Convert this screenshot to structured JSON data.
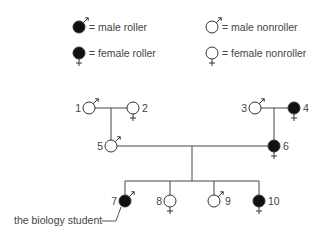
{
  "legend": {
    "items": [
      {
        "id": "male-roller",
        "sex": "male",
        "affected": true,
        "label": "= male roller",
        "cx": 79,
        "cy": 27
      },
      {
        "id": "female-roller",
        "sex": "female",
        "affected": true,
        "label": "= female roller",
        "cx": 79,
        "cy": 53
      },
      {
        "id": "male-nonroller",
        "sex": "male",
        "affected": false,
        "label": "= male nonroller",
        "cx": 212,
        "cy": 27
      },
      {
        "id": "female-nonroller",
        "sex": "female",
        "affected": false,
        "label": "= female nonroller",
        "cx": 212,
        "cy": 53
      }
    ]
  },
  "pedigree": {
    "individuals": [
      {
        "id": "1",
        "label": "1",
        "sex": "male",
        "affected": false,
        "cx": 89,
        "cy": 108,
        "label_side": "left"
      },
      {
        "id": "2",
        "label": "2",
        "sex": "female",
        "affected": false,
        "cx": 133,
        "cy": 108,
        "label_side": "right"
      },
      {
        "id": "3",
        "label": "3",
        "sex": "male",
        "affected": false,
        "cx": 255,
        "cy": 108,
        "label_side": "left"
      },
      {
        "id": "4",
        "label": "4",
        "sex": "female",
        "affected": true,
        "cx": 294,
        "cy": 108,
        "label_side": "right"
      },
      {
        "id": "5",
        "label": "5",
        "sex": "male",
        "affected": false,
        "cx": 111,
        "cy": 146,
        "label_side": "left"
      },
      {
        "id": "6",
        "label": "6",
        "sex": "female",
        "affected": true,
        "cx": 274,
        "cy": 146,
        "label_side": "right"
      },
      {
        "id": "7",
        "label": "7",
        "sex": "male",
        "affected": true,
        "cx": 125,
        "cy": 201,
        "label_side": "left"
      },
      {
        "id": "8",
        "label": "8",
        "sex": "female",
        "affected": false,
        "cx": 170,
        "cy": 201,
        "label_side": "left"
      },
      {
        "id": "9",
        "label": "9",
        "sex": "male",
        "affected": false,
        "cx": 214,
        "cy": 201,
        "label_side": "right"
      },
      {
        "id": "10",
        "label": "10",
        "sex": "female",
        "affected": true,
        "cx": 259,
        "cy": 201,
        "label_side": "right"
      }
    ],
    "lines": [
      {
        "id": "couple-1-2",
        "x1": 95,
        "y1": 108,
        "x2": 127,
        "y2": 108
      },
      {
        "id": "descent-1-2",
        "x1": 111,
        "y1": 108,
        "x2": 111,
        "y2": 140
      },
      {
        "id": "couple-3-4",
        "x1": 261,
        "y1": 108,
        "x2": 288,
        "y2": 108
      },
      {
        "id": "descent-3-4",
        "x1": 274,
        "y1": 108,
        "x2": 274,
        "y2": 140
      },
      {
        "id": "couple-5-6",
        "x1": 117,
        "y1": 146,
        "x2": 268,
        "y2": 146
      },
      {
        "id": "descent-5-6",
        "x1": 192,
        "y1": 146,
        "x2": 192,
        "y2": 181
      },
      {
        "id": "sibship",
        "x1": 125,
        "y1": 181,
        "x2": 259,
        "y2": 181
      },
      {
        "id": "drop-7",
        "x1": 125,
        "y1": 181,
        "x2": 125,
        "y2": 195
      },
      {
        "id": "drop-8",
        "x1": 170,
        "y1": 181,
        "x2": 170,
        "y2": 195
      },
      {
        "id": "drop-9",
        "x1": 214,
        "y1": 181,
        "x2": 214,
        "y2": 195
      },
      {
        "id": "drop-10",
        "x1": 259,
        "y1": 181,
        "x2": 259,
        "y2": 195
      }
    ],
    "annotation": {
      "text": "the biology student",
      "target": "7",
      "x": 14,
      "y": 224
    }
  }
}
